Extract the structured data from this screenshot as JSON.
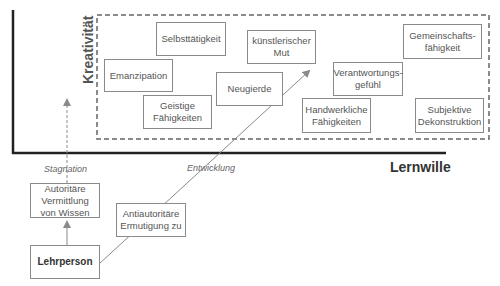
{
  "axes": {
    "y_label": "Kreativität",
    "x_label": "Lernwille"
  },
  "region_boxes": [
    {
      "id": "selbsttaetigkeit",
      "label": "Selbsttätigkeit"
    },
    {
      "id": "emanzipation",
      "label": "Emanzipation"
    },
    {
      "id": "kuenstlerischer-mut",
      "label": "künstlerischer Mut"
    },
    {
      "id": "gemeinschaftsfaehigkeit",
      "label": "Gemeinschafts-fähigkeit"
    },
    {
      "id": "neugierde",
      "label": "Neugierde"
    },
    {
      "id": "verantwortungsgefuehl",
      "label": "Verantwortungs-gefühl"
    },
    {
      "id": "geistige-faehigkeiten",
      "label": "Geistige Fähigkeiten"
    },
    {
      "id": "handwerkliche-faehigkeiten",
      "label": "Handwerkliche Fähigkeiten"
    },
    {
      "id": "subjektive-dekonstruktion",
      "label": "Subjektive Dekonstruktion"
    }
  ],
  "bottom_boxes": {
    "autoritaer": "Autoritäre Vermittlung von Wissen",
    "antiautoritaer": "Antiautoritäre Ermutigung zu",
    "lehrperson": "Lehrperson"
  },
  "arrow_labels": {
    "stagnation": "Stagnation",
    "entwicklung": "Entwicklung"
  },
  "colors": {
    "axis": "#222222",
    "dashed_region": "#666666",
    "arrow": "#8a8a8a",
    "box_border": "#8a8a8a"
  }
}
